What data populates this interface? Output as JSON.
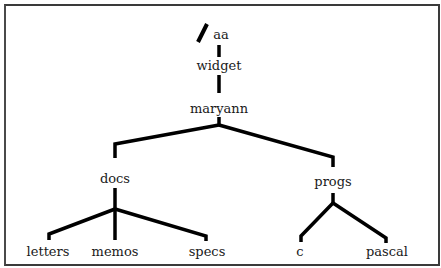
{
  "diagram": {
    "type": "directory-tree",
    "root_marker": "/",
    "nodes": {
      "aa": "aa",
      "widget": "widget",
      "maryann": "maryann",
      "docs": "docs",
      "progs": "progs",
      "letters": "letters",
      "memos": "memos",
      "specs": "specs",
      "c": "c",
      "pascal": "pascal"
    },
    "edges": [
      [
        "/",
        "aa"
      ],
      [
        "aa",
        "widget"
      ],
      [
        "widget",
        "maryann"
      ],
      [
        "maryann",
        "docs"
      ],
      [
        "maryann",
        "progs"
      ],
      [
        "docs",
        "letters"
      ],
      [
        "docs",
        "memos"
      ],
      [
        "docs",
        "specs"
      ],
      [
        "progs",
        "c"
      ],
      [
        "progs",
        "pascal"
      ]
    ],
    "colors": {
      "line": "#000000",
      "text": "#1a1a1a",
      "border": "#3a3a3a",
      "background": "#ffffff"
    }
  }
}
